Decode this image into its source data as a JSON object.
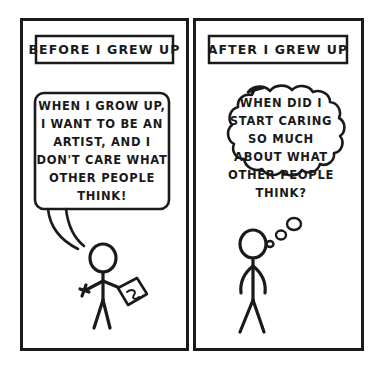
{
  "comic": {
    "title": "Before I Grew Up / After I Grew Up",
    "background_color": "#ffffff",
    "ink_color": "#1a1a1a",
    "panels": [
      {
        "id": "left-panel",
        "caption": "BEFORE I GREW UP",
        "bubble_type": "speech",
        "bubble_lines": [
          "WHEN I GROW UP,",
          "I WANT TO BE AN",
          "ARTIST, AND I",
          "DON'T CARE WHAT",
          "OTHER PEOPLE",
          "THINK!"
        ],
        "figure": {
          "name": "stick-figure-child",
          "pose": "walking, holding paintbrush and canvas",
          "props": [
            "paintbrush",
            "canvas"
          ]
        }
      },
      {
        "id": "right-panel",
        "caption": "AFTER I GREW UP",
        "bubble_type": "thought",
        "bubble_lines": [
          "WHEN DID I",
          "START CARING",
          "SO MUCH",
          "ABOUT WHAT",
          "OTHER PEOPLE",
          "THINK?"
        ],
        "figure": {
          "name": "stick-figure-adult",
          "pose": "standing, arms down",
          "props": []
        }
      }
    ]
  }
}
